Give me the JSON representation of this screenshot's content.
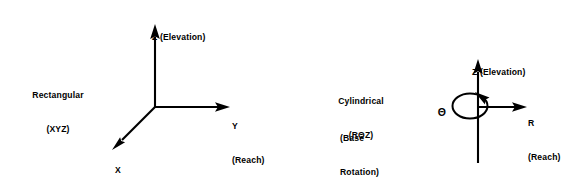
{
  "figure": {
    "background_color": "#ffffff",
    "stroke_color": "#000000",
    "diagrams": [
      {
        "name": "rectangular",
        "system_label_line1": "Rectangular",
        "system_label_line2": "(XYZ)",
        "axes": [
          {
            "symbol": "Z",
            "function": "(Elevation)",
            "label": "Z (Elevation)",
            "direction": "up"
          },
          {
            "symbol": "Y",
            "function": "(Reach)",
            "label": "Y",
            "direction": "right"
          },
          {
            "symbol": "X",
            "function": "(Base Travel)",
            "label": "X",
            "direction": "down-left"
          }
        ],
        "z_label": "Z (Elevation)",
        "y_symbol": "Y",
        "y_function": "(Reach)",
        "x_symbol": "X",
        "x_function": "(Base Travel)"
      },
      {
        "name": "cylindrical",
        "system_label_line1": "Cylindrical",
        "system_label_line2": "(RΘZ)",
        "axes": [
          {
            "symbol": "Z",
            "function": "(Elevation)",
            "label": "Z (Elevation)",
            "direction": "up"
          },
          {
            "symbol": "R",
            "function": "(Reach)",
            "label": "R",
            "direction": "right"
          },
          {
            "symbol": "Θ",
            "function": "(Base Rotation)",
            "label": "Θ",
            "direction": "rotation-about-z"
          }
        ],
        "z_label": "Z (Elevation)",
        "r_symbol": "R",
        "r_function": "(Reach)",
        "theta_symbol": "Θ",
        "theta_function_line1": "(Base",
        "theta_function_line2": "Rotation)"
      }
    ]
  }
}
